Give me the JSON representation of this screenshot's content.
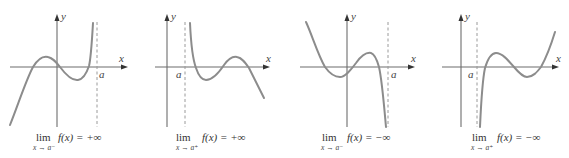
{
  "figure": {
    "colors": {
      "curve": "#8c8c8c",
      "axis": "#6d6d6d",
      "asymptote": "#9a9a9a",
      "text": "#333333"
    },
    "panels": [
      {
        "id": "left-limit-plus-infinity",
        "axis_labels": {
          "x": "x",
          "y": "y",
          "a": "a"
        },
        "caption": {
          "lim": "lim",
          "sub": "x → a⁻",
          "func": "f(x) = +∞"
        }
      },
      {
        "id": "right-limit-plus-infinity",
        "axis_labels": {
          "x": "x",
          "y": "y",
          "a": "a"
        },
        "caption": {
          "lim": "lim",
          "sub": "x → a⁺",
          "func": "f(x) = +∞"
        }
      },
      {
        "id": "left-limit-minus-infinity",
        "axis_labels": {
          "x": "x",
          "y": "y",
          "a": "a"
        },
        "caption": {
          "lim": "lim",
          "sub": "x → a⁻",
          "func": "f(x) = −∞"
        }
      },
      {
        "id": "right-limit-minus-infinity",
        "axis_labels": {
          "x": "x",
          "y": "y",
          "a": "a"
        },
        "caption": {
          "lim": "lim",
          "sub": "x → a⁺",
          "func": "f(x) = −∞"
        }
      }
    ]
  }
}
